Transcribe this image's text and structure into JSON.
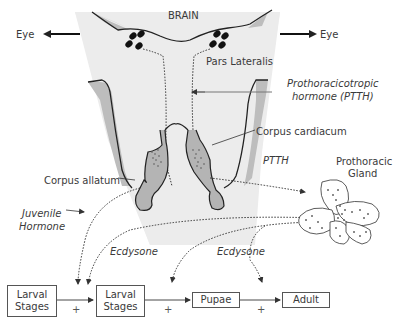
{
  "diagram": {
    "brain_label": "BRAIN",
    "eye_left": "Eye",
    "eye_right": "Eye",
    "pars_lateralis": "Pars Lateralis",
    "ptth_full": [
      "Prothoracicotropic",
      "hormone (PTTH)"
    ],
    "corpus_cardiacum": "Corpus cardiacum",
    "corpus_allatum": "Corpus allatum",
    "ptth_short": "PTTH",
    "prothoracic_gland": [
      "Prothoracic",
      "Gland"
    ],
    "juvenile_hormone": [
      "Juvenile",
      "Hormone"
    ],
    "ecdysone_1": "Ecdysone",
    "ecdysone_2": "Ecdysone",
    "stages": [
      {
        "line1": "Larval",
        "line2": "Stages"
      },
      {
        "line1": "Larval",
        "line2": "Stages"
      },
      {
        "line1": "Pupae",
        "line2": ""
      },
      {
        "line1": "Adult",
        "line2": ""
      }
    ],
    "plus_signs": [
      "+",
      "+",
      "+"
    ],
    "colors": {
      "brain_fill": "#ececec",
      "gland_fill": "#b4b4b4",
      "shadow_fill": "#bdbdbd",
      "stroke": "#222222",
      "text": "#3a3a3a"
    }
  }
}
